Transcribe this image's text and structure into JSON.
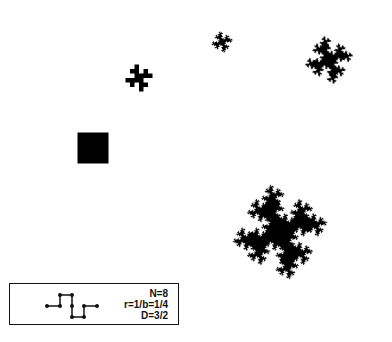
{
  "figure": {
    "colors": {
      "fill": "#000000",
      "background": "#ffffff",
      "box_border": "#111111"
    },
    "stages": [
      {
        "name": "initiator-square",
        "level": 0,
        "cx": 93,
        "cy": 148,
        "size": 31,
        "rotation": 0
      },
      {
        "name": "stage-1",
        "level": 1,
        "cx": 139,
        "cy": 78,
        "size": 18,
        "rotation": 0
      },
      {
        "name": "stage-2",
        "level": 2,
        "cx": 222,
        "cy": 42,
        "size": 13,
        "rotation": 0
      },
      {
        "name": "stage-3",
        "level": 3,
        "cx": 329,
        "cy": 60,
        "size": 29,
        "rotation": 0
      },
      {
        "name": "stage-4",
        "level": 4,
        "cx": 280,
        "cy": 232,
        "size": 57,
        "rotation": 0
      }
    ]
  },
  "legend": {
    "N": "N=8",
    "r": "r=1/b=1/4",
    "D": "D=3/2",
    "generator_points": [
      [
        47,
        306
      ],
      [
        60,
        306
      ],
      [
        60,
        295
      ],
      [
        72,
        295
      ],
      [
        72,
        306
      ],
      [
        72,
        317
      ],
      [
        84,
        317
      ],
      [
        84,
        306
      ],
      [
        97,
        306
      ]
    ]
  },
  "caption": ""
}
